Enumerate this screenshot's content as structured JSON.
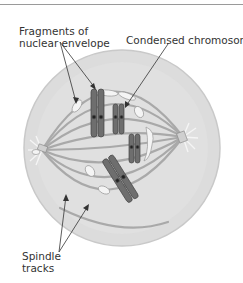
{
  "figure": {
    "labels": {
      "nuclear_envelope_line1": "Fragments of",
      "nuclear_envelope_line2": "nuclear envelope",
      "condensed_chromosome": "Condensed chromosome",
      "spindle_line1": "Spindle",
      "spindle_line2": "tracks"
    },
    "colors": {
      "cytoplasm": "#d9d9d9",
      "cell_border": "#c6c6c6",
      "spindle": "#a8a8a8",
      "chromosome": "#6e6e6e",
      "chromosome_dark": "#3e3e3e",
      "envelope_fragment": "#f4f4f4"
    }
  }
}
